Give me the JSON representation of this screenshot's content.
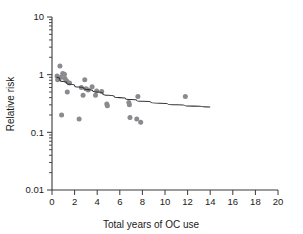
{
  "chart_data": {
    "type": "scatter",
    "title": "",
    "xlabel": "Total years of OC use",
    "ylabel": "Relative risk",
    "yscale": "log",
    "xscale": "linear",
    "xlim": [
      0,
      20
    ],
    "ylim": [
      0.01,
      10
    ],
    "grid": false,
    "legend": null,
    "x_ticks": [
      0,
      2,
      4,
      6,
      8,
      10,
      12,
      14,
      16,
      18,
      20
    ],
    "x_tick_labels": [
      "0",
      "2",
      "4",
      "6",
      "8",
      "10",
      "12",
      "14",
      "16",
      "18",
      "20"
    ],
    "y_ticks": [
      0.01,
      0.1,
      1,
      10
    ],
    "y_tick_labels": [
      "0.01",
      "0.1",
      "1",
      "10"
    ],
    "marker_color": "#8a8a8f",
    "line_color": "#333333",
    "axis_color": "#3a3a3a",
    "points": [
      {
        "x": 0.45,
        "y": 0.95
      },
      {
        "x": 0.5,
        "y": 0.82
      },
      {
        "x": 0.7,
        "y": 1.42
      },
      {
        "x": 0.8,
        "y": 0.9
      },
      {
        "x": 0.95,
        "y": 1.05
      },
      {
        "x": 1.1,
        "y": 1.02
      },
      {
        "x": 1.15,
        "y": 0.86
      },
      {
        "x": 1.3,
        "y": 0.78
      },
      {
        "x": 0.85,
        "y": 0.2
      },
      {
        "x": 1.35,
        "y": 0.5
      },
      {
        "x": 1.55,
        "y": 0.72
      },
      {
        "x": 2.4,
        "y": 0.17
      },
      {
        "x": 2.6,
        "y": 0.6
      },
      {
        "x": 2.75,
        "y": 0.44
      },
      {
        "x": 2.9,
        "y": 0.82
      },
      {
        "x": 3.0,
        "y": 0.57
      },
      {
        "x": 3.2,
        "y": 0.54
      },
      {
        "x": 3.55,
        "y": 0.62
      },
      {
        "x": 3.85,
        "y": 0.44
      },
      {
        "x": 3.95,
        "y": 0.52
      },
      {
        "x": 4.4,
        "y": 0.51
      },
      {
        "x": 4.85,
        "y": 0.31
      },
      {
        "x": 4.9,
        "y": 0.29
      },
      {
        "x": 6.8,
        "y": 0.33
      },
      {
        "x": 6.85,
        "y": 0.3
      },
      {
        "x": 6.9,
        "y": 0.18
      },
      {
        "x": 7.5,
        "y": 0.17
      },
      {
        "x": 7.85,
        "y": 0.15
      },
      {
        "x": 7.6,
        "y": 0.42
      },
      {
        "x": 11.8,
        "y": 0.42
      }
    ],
    "fit_curve": {
      "description": "fitted declining trend line",
      "x_start": 0.4,
      "x_end": 14.0,
      "points": [
        {
          "x": 0.4,
          "y": 0.9
        },
        {
          "x": 1.0,
          "y": 0.76
        },
        {
          "x": 1.6,
          "y": 0.68
        },
        {
          "x": 2.4,
          "y": 0.61
        },
        {
          "x": 3.2,
          "y": 0.55
        },
        {
          "x": 4.0,
          "y": 0.5
        },
        {
          "x": 5.0,
          "y": 0.44
        },
        {
          "x": 6.0,
          "y": 0.4
        },
        {
          "x": 7.0,
          "y": 0.37
        },
        {
          "x": 8.0,
          "y": 0.345
        },
        {
          "x": 9.5,
          "y": 0.32
        },
        {
          "x": 11.0,
          "y": 0.3
        },
        {
          "x": 12.5,
          "y": 0.285
        },
        {
          "x": 14.0,
          "y": 0.275
        }
      ]
    }
  }
}
